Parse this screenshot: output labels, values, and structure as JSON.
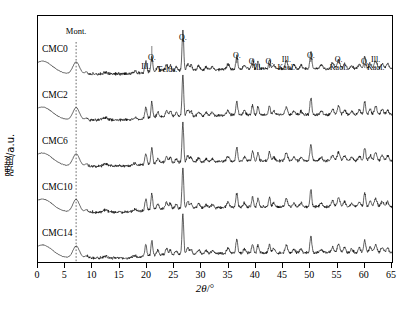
{
  "axes": {
    "ylabel": "强度/a.u.",
    "xlabel_sym": "2θ",
    "xlabel_unit": "/°",
    "xticks": [
      0,
      5,
      10,
      15,
      20,
      25,
      30,
      35,
      40,
      45,
      50,
      55,
      60,
      65
    ]
  },
  "samples": [
    {
      "label": "CMC0",
      "offset": 0
    },
    {
      "label": "CMC2",
      "offset": 1
    },
    {
      "label": "CMC6",
      "offset": 2
    },
    {
      "label": "CMC10",
      "offset": 3
    },
    {
      "label": "CMC14",
      "offset": 4
    }
  ],
  "guide": {
    "label": "Mont.",
    "two_theta": 7.0
  },
  "peak_labels": [
    {
      "text": "Ill.",
      "two_theta": 19.8,
      "y": 47
    },
    {
      "text": "Q.",
      "two_theta": 20.9,
      "y": 38
    },
    {
      "text": "Felds.",
      "two_theta": 23.8,
      "y": 50
    },
    {
      "text": "Q.",
      "two_theta": 26.6,
      "y": 18
    },
    {
      "text": "Q.",
      "two_theta": 36.5,
      "y": 36
    },
    {
      "text": "Q.",
      "two_theta": 39.4,
      "y": 42
    },
    {
      "text": "Ill.",
      "two_theta": 40.4,
      "y": 48
    },
    {
      "text": "Q.",
      "two_theta": 42.5,
      "y": 42
    },
    {
      "text": "Ill.\nKaol.",
      "two_theta": 45.6,
      "y": 40
    },
    {
      "text": "Q.",
      "two_theta": 50.1,
      "y": 36
    },
    {
      "text": "Q.\nKaol.",
      "two_theta": 55.2,
      "y": 40
    },
    {
      "text": "Q.",
      "two_theta": 60.0,
      "y": 42
    },
    {
      "text": "Ill.\nKaol.",
      "two_theta": 62.0,
      "y": 40
    }
  ],
  "chart_data": {
    "type": "line",
    "title": "",
    "xlabel": "2θ/°",
    "ylabel": "强度/a.u.",
    "xlim": [
      0,
      65
    ],
    "grid": false,
    "legend": "inline-left-labels",
    "n_series": 5,
    "series_offset_px": 46,
    "note": "Stacked XRD patterns of five CMC-modified clay samples; intensity axis arbitrary units, traces vertically offset.",
    "series": [
      {
        "name": "CMC0",
        "peaks_two_theta": [
          7.0,
          19.8,
          20.9,
          23.8,
          26.6,
          36.5,
          39.4,
          40.4,
          42.5,
          45.6,
          50.1,
          55.2,
          60.0,
          62.0
        ]
      },
      {
        "name": "CMC2",
        "peaks_two_theta": [
          7.0,
          19.8,
          20.9,
          23.8,
          26.6,
          36.5,
          39.4,
          40.4,
          42.5,
          45.6,
          50.1,
          55.2,
          60.0,
          62.0
        ]
      },
      {
        "name": "CMC6",
        "peaks_two_theta": [
          7.0,
          19.8,
          20.9,
          23.8,
          26.6,
          36.5,
          39.4,
          40.4,
          42.5,
          45.6,
          50.1,
          55.2,
          60.0,
          62.0
        ]
      },
      {
        "name": "CMC10",
        "peaks_two_theta": [
          7.0,
          19.8,
          20.9,
          23.8,
          26.6,
          36.5,
          39.4,
          40.4,
          42.5,
          45.6,
          50.1,
          55.2,
          60.0,
          62.0
        ]
      },
      {
        "name": "CMC14",
        "peaks_two_theta": [
          7.0,
          19.8,
          20.9,
          23.8,
          26.6,
          36.5,
          39.4,
          40.4,
          42.5,
          45.6,
          50.1,
          55.2,
          60.0,
          62.0
        ]
      }
    ],
    "phase_assignments": [
      {
        "phase": "Mont.",
        "two_theta": 7.0
      },
      {
        "phase": "Ill.",
        "two_theta": 19.8
      },
      {
        "phase": "Q.",
        "two_theta": 20.9
      },
      {
        "phase": "Felds.",
        "two_theta": 23.8
      },
      {
        "phase": "Q.",
        "two_theta": 26.6
      },
      {
        "phase": "Q.",
        "two_theta": 36.5
      },
      {
        "phase": "Q.",
        "two_theta": 39.4
      },
      {
        "phase": "Ill.",
        "two_theta": 40.4
      },
      {
        "phase": "Q.",
        "two_theta": 42.5
      },
      {
        "phase": "Ill./Kaol.",
        "two_theta": 45.6
      },
      {
        "phase": "Q.",
        "two_theta": 50.1
      },
      {
        "phase": "Q./Kaol.",
        "two_theta": 55.2
      },
      {
        "phase": "Q.",
        "two_theta": 60.0
      },
      {
        "phase": "Ill./Kaol.",
        "two_theta": 62.0
      }
    ]
  }
}
